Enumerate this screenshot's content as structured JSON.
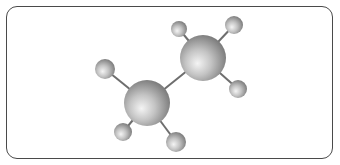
{
  "diagram": {
    "molecule": "ethane",
    "formula": "C2H6",
    "style": "ball-and-stick",
    "colors": {
      "frame_border": "#4a4a4a",
      "bond": "#6e6e6e",
      "atom_highlight": "#f2f2f2",
      "atom_mid": "#bdbdbd",
      "atom_edge": "#7a7a7a"
    },
    "atoms": [
      {
        "id": "C1",
        "element": "C",
        "x": 147,
        "y": 103,
        "r": 23
      },
      {
        "id": "C2",
        "element": "C",
        "x": 203,
        "y": 58,
        "r": 23
      },
      {
        "id": "H1",
        "element": "H",
        "x": 105,
        "y": 69,
        "r": 10
      },
      {
        "id": "H2",
        "element": "H",
        "x": 123,
        "y": 132,
        "r": 9
      },
      {
        "id": "H3",
        "element": "H",
        "x": 176,
        "y": 142,
        "r": 10
      },
      {
        "id": "H4",
        "element": "H",
        "x": 179,
        "y": 29,
        "r": 8
      },
      {
        "id": "H5",
        "element": "H",
        "x": 234,
        "y": 25,
        "r": 9
      },
      {
        "id": "H6",
        "element": "H",
        "x": 238,
        "y": 89,
        "r": 9
      }
    ],
    "bonds": [
      [
        "C1",
        "C2"
      ],
      [
        "C1",
        "H1"
      ],
      [
        "C1",
        "H2"
      ],
      [
        "C1",
        "H3"
      ],
      [
        "C2",
        "H4"
      ],
      [
        "C2",
        "H5"
      ],
      [
        "C2",
        "H6"
      ]
    ]
  }
}
